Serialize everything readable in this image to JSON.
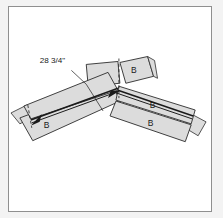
{
  "diagram": {
    "background_color": "#f3f3f3",
    "panel_color": "#ffffff",
    "border_color": "#8f8f8f",
    "board_fill": "#dcdcdc",
    "board_stroke": "#2b2b2b",
    "annotation_color": "#1a1a1a",
    "dimension": {
      "name": "overall-length",
      "value": "28 3/4\"",
      "leader": "line from text down-right to left board upper edge",
      "arrow_style": "single arrow at left end, arrow at apex"
    },
    "labels": [
      {
        "id": "b-top-right",
        "text": "B"
      },
      {
        "id": "b-right-upper",
        "text": "B"
      },
      {
        "id": "b-right-lower",
        "text": "B"
      },
      {
        "id": "b-left-lower",
        "text": "B"
      }
    ],
    "parts": [
      {
        "id": "left-arm-upper",
        "label": "",
        "note": "long board sloping down-left from apex"
      },
      {
        "id": "left-arm-lower",
        "label": "B",
        "note": "second board below left arm"
      },
      {
        "id": "right-arm-upper",
        "label": "B",
        "note": "long board sloping down-right from apex"
      },
      {
        "id": "right-arm-lower",
        "label": "B",
        "note": "second board below right arm"
      },
      {
        "id": "peak-board-left",
        "label": "",
        "note": "short board at peak angled up-left"
      },
      {
        "id": "peak-board-right",
        "label": "B",
        "note": "short board at peak angled up-right"
      },
      {
        "id": "left-end-cap",
        "label": "",
        "note": "small end block at far left"
      },
      {
        "id": "right-end-cap",
        "label": "",
        "note": "small end block at far right"
      }
    ],
    "center_line": {
      "name": "apex-centerline",
      "style": "dashed vertical"
    }
  }
}
